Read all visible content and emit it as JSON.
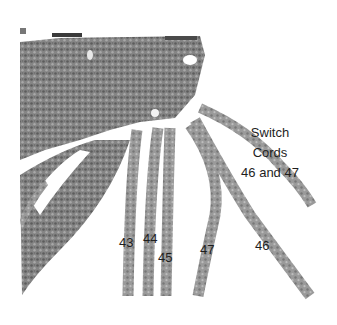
{
  "figure": {
    "style": "grayscale photograph",
    "colors": {
      "background": "#ffffff",
      "cord": "#8a8a8a",
      "cord_dark": "#5a5a5a",
      "knot_band": "#6e6e6e",
      "text": "#1e1e1e"
    }
  },
  "callout": {
    "line1": "Switch",
    "line2": "Cords",
    "line3": "46 and 47"
  },
  "cord_labels": [
    {
      "id": "43",
      "text": "43",
      "x": 119,
      "y": 235
    },
    {
      "id": "44",
      "text": "44",
      "x": 143,
      "y": 231
    },
    {
      "id": "45",
      "text": "45",
      "x": 158,
      "y": 250
    },
    {
      "id": "47",
      "text": "47",
      "x": 200,
      "y": 242
    },
    {
      "id": "46",
      "text": "46",
      "x": 255,
      "y": 238
    }
  ]
}
